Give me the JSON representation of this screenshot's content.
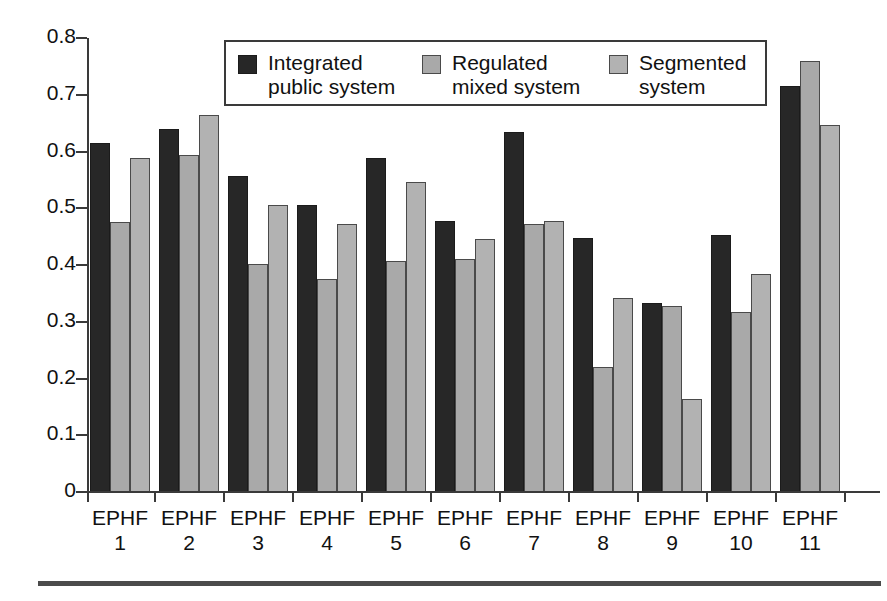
{
  "chart_data": {
    "type": "bar",
    "title": "",
    "subtitle": "",
    "xlabel": "",
    "ylabel": "",
    "ylim": [
      0,
      0.8
    ],
    "ytick_labels": [
      "0.8",
      "0.7",
      "0.6",
      "0.5",
      "0.4",
      "0.3",
      "0.2",
      "0.1",
      "0"
    ],
    "ytick_values": [
      0.8,
      0.7,
      0.6,
      0.5,
      0.4,
      0.3,
      0.2,
      0.1,
      0
    ],
    "grid": false,
    "legend_position": "top-center",
    "categories": [
      "EPHF 1",
      "EPHF 2",
      "EPHF 3",
      "EPHF 4",
      "EPHF 5",
      "EPHF 6",
      "EPHF 7",
      "EPHF 8",
      "EPHF 9",
      "EPHF 10",
      "EPHF 11"
    ],
    "category_lines": [
      [
        "EPHF",
        "1"
      ],
      [
        "EPHF",
        "2"
      ],
      [
        "EPHF",
        "3"
      ],
      [
        "EPHF",
        "4"
      ],
      [
        "EPHF",
        "5"
      ],
      [
        "EPHF",
        "6"
      ],
      [
        "EPHF",
        "7"
      ],
      [
        "EPHF",
        "8"
      ],
      [
        "EPHF",
        "9"
      ],
      [
        "EPHF",
        "10"
      ],
      [
        "EPHF",
        "11"
      ]
    ],
    "series": [
      {
        "name": "Integrated public system",
        "name_lines": [
          "Integrated",
          "public system"
        ],
        "color": "#272727",
        "values": [
          0.615,
          0.64,
          0.556,
          0.506,
          0.589,
          0.477,
          0.635,
          0.447,
          0.333,
          0.452,
          0.716
        ]
      },
      {
        "name": "Regulated mixed system",
        "name_lines": [
          "Regulated",
          "mixed system"
        ],
        "color": "#a9a9a9",
        "values": [
          0.476,
          0.594,
          0.401,
          0.375,
          0.407,
          0.41,
          0.473,
          0.22,
          0.328,
          0.318,
          0.76
        ]
      },
      {
        "name": "Segmented system",
        "name_lines": [
          "Segmented",
          "system"
        ],
        "color": "#b2b2b2",
        "values": [
          0.588,
          0.664,
          0.505,
          0.472,
          0.547,
          0.445,
          0.477,
          0.342,
          0.163,
          0.385,
          0.646
        ]
      }
    ]
  }
}
